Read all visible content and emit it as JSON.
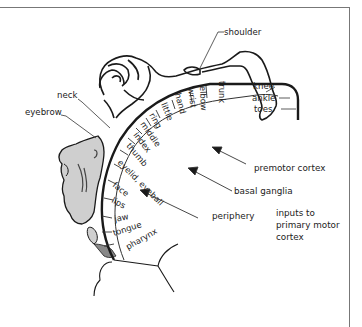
{
  "diagram": {
    "callout_labels": {
      "shoulder": "shoulder",
      "neck": "neck",
      "eyebrow": "eyebrow",
      "knee": "knee",
      "ankle": "ankle",
      "toes": "toes"
    },
    "arc_labels": {
      "trunk": "trunk",
      "elbow": "elbow",
      "wrist": "wrist",
      "hand": "hand",
      "little": "little",
      "ring": "ring",
      "middle": "middle",
      "index": "index",
      "thumb": "thumb",
      "eyelid_eyeball": "eyelid, eyeball",
      "face": "face",
      "lips": "lips",
      "jaw": "jaw",
      "tongue": "tongue",
      "pharynx": "pharynx"
    },
    "inputs": {
      "premotor": "premotor cortex",
      "basal_ganglia": "basal ganglia",
      "periphery": "periphery",
      "title_line1": "inputs to",
      "title_line2": "primary motor",
      "title_line3": "cortex"
    },
    "colors": {
      "line": "#1a1a1a",
      "face_fill": "#cfcfcf",
      "frame": "#777777"
    }
  }
}
